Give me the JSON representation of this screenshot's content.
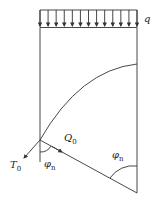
{
  "diagram": {
    "labels": {
      "load": "q",
      "tension": "T",
      "tension_sub": "0",
      "shear": "Q",
      "shear_sub": "0",
      "angle_top": "φ",
      "angle_top_sub": "n",
      "angle_bottom": "φ",
      "angle_bottom_sub": "n"
    },
    "load_arrow_count": 13,
    "stroke_color": "#333333"
  }
}
